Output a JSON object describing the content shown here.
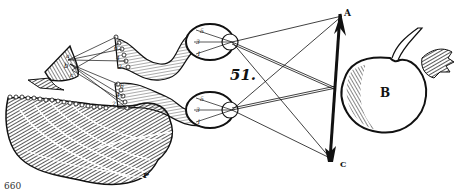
{
  "figure": {
    "figure_number": "51.",
    "page_number": "660",
    "labels": {
      "arrow_top": "A",
      "apple": "B",
      "arrow_bottom": "C",
      "brain_region": "P",
      "gland_a": "a",
      "gland_b": "b",
      "gland_c": "c",
      "upper_eye_points": [
        "5",
        "3",
        "1"
      ],
      "lower_eye_points": [
        "5",
        "3",
        "1"
      ],
      "upper_nerve_points": [
        "6",
        "4",
        "2"
      ],
      "lower_nerve_points": [
        "6",
        "4",
        "2"
      ]
    },
    "colors": {
      "ink": "#111111",
      "paper": "#ffffff"
    }
  }
}
